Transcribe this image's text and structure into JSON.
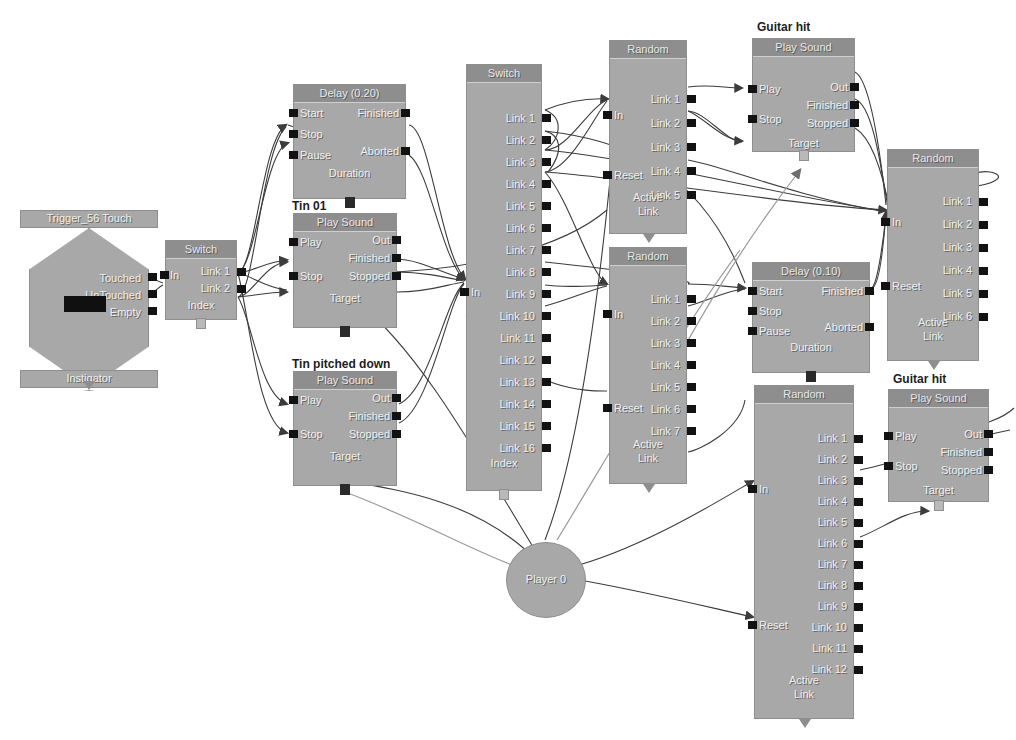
{
  "graph": {
    "title_fragment": "presenting crop edge",
    "wire_color": "#3c3c3c",
    "node_body_color": "#a8a8a8",
    "node_header_color": "#8e8e8e",
    "pin_color": "#121212",
    "label_color": "#f0f0f0",
    "caption_color": "#1d1d1d",
    "background": "#ffffff"
  },
  "nodes": {
    "trigger": {
      "title": "Trigger_56 Touch",
      "footer": "Instigator",
      "outputs": [
        "Touched",
        "UnTouched",
        "Empty"
      ]
    },
    "switch_small": {
      "title": "Switch",
      "inputs": [
        "In"
      ],
      "outputs": [
        "Link 1",
        "Link 2"
      ],
      "footer": "Index"
    },
    "delay_020": {
      "title": "Delay (0.20)",
      "inputs": [
        "Start",
        "Stop",
        "Pause"
      ],
      "outputs": [
        "Finished",
        "Aborted"
      ],
      "footer": "Duration"
    },
    "playsound_tin01": {
      "caption": "Tin 01",
      "title": "Play Sound",
      "inputs": [
        "Play",
        "Stop"
      ],
      "outputs": [
        "Out",
        "Finished",
        "Stopped"
      ],
      "footer": "Target"
    },
    "playsound_tin_pitched": {
      "caption": "Tin pitched down",
      "title": "Play Sound",
      "inputs": [
        "Play",
        "Stop"
      ],
      "outputs": [
        "Out",
        "Finished",
        "Stopped"
      ],
      "footer": "Target"
    },
    "switch_big": {
      "title": "Switch",
      "inputs": [
        "In"
      ],
      "outputs": [
        "Link 1",
        "Link 2",
        "Link 3",
        "Link 4",
        "Link 5",
        "Link 6",
        "Link 7",
        "Link 8",
        "Link 9",
        "Link 10",
        "Link 11",
        "Link 12",
        "Link 13",
        "Link 14",
        "Link 15",
        "Link 16"
      ],
      "footer": "Index"
    },
    "random_top": {
      "title": "Random",
      "inputs": [
        "In",
        "Reset"
      ],
      "outputs": [
        "Link 1",
        "Link 2",
        "Link 3",
        "Link 4",
        "Link 5"
      ],
      "footer_line1": "Active",
      "footer_line2": "Link"
    },
    "random_mid": {
      "title": "Random",
      "inputs": [
        "In",
        "Reset"
      ],
      "outputs": [
        "Link 1",
        "Link 2",
        "Link 3",
        "Link 4",
        "Link 5",
        "Link 6",
        "Link 7"
      ],
      "footer_line1": "Active",
      "footer_line2": "Link"
    },
    "random_right": {
      "title": "Random",
      "inputs": [
        "In",
        "Reset"
      ],
      "outputs": [
        "Link 1",
        "Link 2",
        "Link 3",
        "Link 4",
        "Link 5",
        "Link 6"
      ],
      "footer_line1": "Active",
      "footer_line2": "Link"
    },
    "random_bottom": {
      "title": "Random",
      "inputs": [
        "In",
        "Reset"
      ],
      "outputs": [
        "Link 1",
        "Link 2",
        "Link 3",
        "Link 4",
        "Link 5",
        "Link 6",
        "Link 7",
        "Link 8",
        "Link 9",
        "Link 10",
        "Link 11",
        "Link 12"
      ],
      "footer_line1": "Active",
      "footer_line2": "Link"
    },
    "playsound_guitar_top": {
      "caption": "Guitar hit",
      "title": "Play Sound",
      "inputs": [
        "Play",
        "Stop"
      ],
      "outputs": [
        "Out",
        "Finished",
        "Stopped"
      ],
      "footer": "Target"
    },
    "playsound_guitar_bottom": {
      "caption": "Guitar hit",
      "title": "Play Sound",
      "inputs": [
        "Play",
        "Stop"
      ],
      "outputs": [
        "Out",
        "Finished",
        "Stopped"
      ],
      "footer": "Target"
    },
    "delay_010": {
      "title": "Delay (0.10)",
      "inputs": [
        "Start",
        "Stop",
        "Pause"
      ],
      "outputs": [
        "Finished",
        "Aborted"
      ],
      "footer": "Duration"
    },
    "player": {
      "label": "Player 0"
    }
  }
}
